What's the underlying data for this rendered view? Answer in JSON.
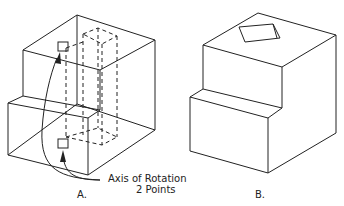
{
  "figures": {
    "a": {
      "label": "A.",
      "annotation_line1": "Axis of Rotation",
      "annotation_line2": "2 Points"
    },
    "b": {
      "label": "B."
    }
  },
  "colors": {
    "line": "#222222",
    "background": "#ffffff"
  }
}
